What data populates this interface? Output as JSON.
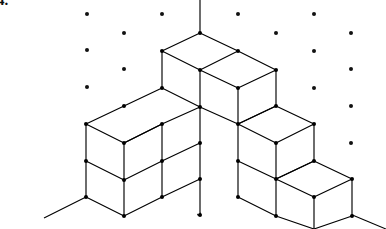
{
  "figure": {
    "label": "4.",
    "type": "isometric-block-diagram",
    "canvas": {
      "width": 386,
      "height": 229,
      "background": "#ffffff"
    },
    "style": {
      "line_color": "#000000",
      "face_color": "#ffffff",
      "dot_color": "#111111",
      "line_width": 1.15,
      "grid_dot_radius": 2.0,
      "vertex_dot_radius": 2.0
    },
    "projection": {
      "origin_x": 200,
      "origin_y": 33,
      "half_width": 37.5,
      "half_height": 18.5,
      "cube_height": 37
    },
    "axes": [
      {
        "name": "vertical-axis",
        "x1": 200,
        "y1": 0,
        "x2": 200,
        "y2": 33
      },
      {
        "name": "left-axis",
        "x1": 86,
        "y1": 197,
        "x2": 44,
        "y2": 218
      },
      {
        "name": "right-axis",
        "x1": 350,
        "y1": 214,
        "x2": 386,
        "y2": 229
      }
    ],
    "grid_dots": [
      {
        "x": 87,
        "y": 14
      },
      {
        "x": 124,
        "y": 33
      },
      {
        "x": 87,
        "y": 50
      },
      {
        "x": 124,
        "y": 69
      },
      {
        "x": 87,
        "y": 87
      },
      {
        "x": 162,
        "y": 14
      },
      {
        "x": 238,
        "y": 14
      },
      {
        "x": 276,
        "y": 33
      },
      {
        "x": 314,
        "y": 14
      },
      {
        "x": 351,
        "y": 33
      },
      {
        "x": 314,
        "y": 51
      },
      {
        "x": 351,
        "y": 69
      },
      {
        "x": 314,
        "y": 88
      },
      {
        "x": 351,
        "y": 106
      },
      {
        "x": 351,
        "y": 143
      },
      {
        "x": 199,
        "y": 214
      }
    ],
    "faces": [
      {
        "name": "top-face-apex-left",
        "kind": "top",
        "points": "200,33 162,51 200,70 238,51"
      },
      {
        "name": "top-face-apex-right",
        "kind": "top",
        "points": "238,51 200,70 238,88 276,70"
      },
      {
        "name": "top-face-left-upper",
        "kind": "top",
        "points": "124,106 86,124 124,143 162,124"
      },
      {
        "name": "top-face-left-mid",
        "kind": "top",
        "points": "162,88 124,106 162,124 200,106"
      },
      {
        "name": "top-face-step-mid",
        "kind": "top",
        "points": "276,106 238,124 276,143 314,124"
      },
      {
        "name": "top-face-step-low",
        "kind": "top",
        "points": "314,161 276,179 314,197 352,179"
      },
      {
        "name": "left-face-apex",
        "kind": "left",
        "points": "162,51 162,88 200,106 200,70"
      },
      {
        "name": "left-face-upper-l",
        "kind": "left",
        "points": "86,124 86,161 124,180 124,143"
      },
      {
        "name": "left-face-lower-l",
        "kind": "left",
        "points": "86,161 86,197 124,216 124,180"
      },
      {
        "name": "left-face-mid",
        "kind": "left",
        "points": "162,124 162,161 200,179 200,143"
      },
      {
        "name": "left-face-mid-low",
        "kind": "left",
        "points": "162,161 162,197 200,215 200,179"
      },
      {
        "name": "left-face-step-mid",
        "kind": "left",
        "points": "238,124 238,161 276,179 276,143"
      },
      {
        "name": "left-face-step-midlow",
        "kind": "left",
        "points": "238,161 238,197 276,215 276,179"
      },
      {
        "name": "left-face-step-low",
        "kind": "left",
        "points": "276,179 276,216 314,229 314,197"
      },
      {
        "name": "right-face-apex",
        "kind": "right",
        "points": "238,88 238,124 276,106 276,70"
      },
      {
        "name": "right-face-upper-r",
        "kind": "right",
        "points": "162,124 162,161 200,143 200,106"
      },
      {
        "name": "right-face-step-mid",
        "kind": "right",
        "points": "276,143 276,179 314,161 314,124"
      },
      {
        "name": "right-face-step-low",
        "kind": "right",
        "points": "314,197 314,229 352,216 352,179"
      }
    ],
    "edges": [
      {
        "name": "e-top-apex-nw",
        "x1": 200,
        "y1": 33,
        "x2": 162,
        "y2": 51
      },
      {
        "name": "e-top-apex-ne",
        "x1": 200,
        "y1": 33,
        "x2": 238,
        "y2": 51
      },
      {
        "name": "e-top-apex-sw",
        "x1": 162,
        "y1": 51,
        "x2": 200,
        "y2": 70
      },
      {
        "name": "e-top-apex-se",
        "x1": 238,
        "y1": 51,
        "x2": 200,
        "y2": 70
      },
      {
        "name": "e-top-r-ne",
        "x1": 238,
        "y1": 51,
        "x2": 276,
        "y2": 70
      },
      {
        "name": "e-top-r-se",
        "x1": 276,
        "y1": 70,
        "x2": 238,
        "y2": 88
      },
      {
        "name": "e-top-r-sw",
        "x1": 238,
        "y1": 88,
        "x2": 200,
        "y2": 70
      },
      {
        "name": "e-v-162-51",
        "x1": 162,
        "y1": 51,
        "x2": 162,
        "y2": 88
      },
      {
        "name": "e-v-200-70",
        "x1": 200,
        "y1": 70,
        "x2": 200,
        "y2": 107
      },
      {
        "name": "e-v-238-88",
        "x1": 238,
        "y1": 88,
        "x2": 238,
        "y2": 124
      },
      {
        "name": "e-v-276-70",
        "x1": 276,
        "y1": 70,
        "x2": 276,
        "y2": 106
      },
      {
        "name": "e-b-apex-sw",
        "x1": 162,
        "y1": 88,
        "x2": 200,
        "y2": 107
      },
      {
        "name": "e-b-apex-se",
        "x1": 238,
        "y1": 124,
        "x2": 200,
        "y2": 107
      },
      {
        "name": "e-b-apex-ne",
        "x1": 238,
        "y1": 124,
        "x2": 276,
        "y2": 106
      },
      {
        "name": "e-l-top-nw",
        "x1": 124,
        "y1": 106,
        "x2": 86,
        "y2": 124
      },
      {
        "name": "e-l-top-ne",
        "x1": 124,
        "y1": 106,
        "x2": 162,
        "y2": 88
      },
      {
        "name": "e-l-top-w-s",
        "x1": 86,
        "y1": 124,
        "x2": 124,
        "y2": 143
      },
      {
        "name": "e-l-top-mid-d",
        "x1": 124,
        "y1": 143,
        "x2": 162,
        "y2": 124
      },
      {
        "name": "e-l-top-e-d",
        "x1": 162,
        "y1": 124,
        "x2": 200,
        "y2": 107
      },
      {
        "name": "e-l-top-inner",
        "x1": 124,
        "y1": 143,
        "x2": 162,
        "y2": 124
      },
      {
        "name": "e-v-86-124",
        "x1": 86,
        "y1": 124,
        "x2": 86,
        "y2": 197
      },
      {
        "name": "e-v-124-143",
        "x1": 124,
        "y1": 143,
        "x2": 124,
        "y2": 216
      },
      {
        "name": "e-v-162-124",
        "x1": 162,
        "y1": 124,
        "x2": 162,
        "y2": 197
      },
      {
        "name": "e-v-200-107",
        "x1": 200,
        "y1": 107,
        "x2": 200,
        "y2": 215
      },
      {
        "name": "e-l-mid-h1",
        "x1": 86,
        "y1": 161,
        "x2": 124,
        "y2": 180
      },
      {
        "name": "e-l-mid-h2",
        "x1": 124,
        "y1": 180,
        "x2": 162,
        "y2": 161
      },
      {
        "name": "e-l-mid-h3",
        "x1": 162,
        "y1": 161,
        "x2": 200,
        "y2": 143
      },
      {
        "name": "e-l-bot-h1",
        "x1": 86,
        "y1": 197,
        "x2": 124,
        "y2": 216
      },
      {
        "name": "e-l-bot-h2",
        "x1": 124,
        "y1": 216,
        "x2": 162,
        "y2": 197
      },
      {
        "name": "e-l-bot-h3",
        "x1": 162,
        "y1": 197,
        "x2": 200,
        "y2": 179
      },
      {
        "name": "e-s-top-nw",
        "x1": 276,
        "y1": 106,
        "x2": 238,
        "y2": 124
      },
      {
        "name": "e-s-top-ne",
        "x1": 276,
        "y1": 106,
        "x2": 314,
        "y2": 124
      },
      {
        "name": "e-s-top-sw",
        "x1": 238,
        "y1": 124,
        "x2": 276,
        "y2": 143
      },
      {
        "name": "e-s-top-se",
        "x1": 314,
        "y1": 124,
        "x2": 276,
        "y2": 143
      },
      {
        "name": "e-v-314-124",
        "x1": 314,
        "y1": 124,
        "x2": 314,
        "y2": 161
      },
      {
        "name": "e-v-276-143",
        "x1": 276,
        "y1": 143,
        "x2": 276,
        "y2": 216
      },
      {
        "name": "e-v-238-124b",
        "x1": 238,
        "y1": 124,
        "x2": 238,
        "y2": 197
      },
      {
        "name": "e-s-mid-h1",
        "x1": 238,
        "y1": 161,
        "x2": 276,
        "y2": 179
      },
      {
        "name": "e-s-mid-h2",
        "x1": 276,
        "y1": 179,
        "x2": 314,
        "y2": 161
      },
      {
        "name": "e-s-bot-h1",
        "x1": 238,
        "y1": 197,
        "x2": 276,
        "y2": 216
      },
      {
        "name": "e-s2-top-nw",
        "x1": 314,
        "y1": 161,
        "x2": 276,
        "y2": 179
      },
      {
        "name": "e-s2-top-ne",
        "x1": 314,
        "y1": 161,
        "x2": 352,
        "y2": 179
      },
      {
        "name": "e-s2-top-sw",
        "x1": 276,
        "y1": 179,
        "x2": 314,
        "y2": 197
      },
      {
        "name": "e-s2-top-se",
        "x1": 352,
        "y1": 179,
        "x2": 314,
        "y2": 197
      },
      {
        "name": "e-v-352-179",
        "x1": 352,
        "y1": 179,
        "x2": 352,
        "y2": 216
      },
      {
        "name": "e-v-314-197",
        "x1": 314,
        "y1": 197,
        "x2": 314,
        "y2": 229
      },
      {
        "name": "e-s2-bot-h1",
        "x1": 276,
        "y1": 216,
        "x2": 314,
        "y2": 229
      },
      {
        "name": "e-s2-bot-h2",
        "x1": 314,
        "y1": 229,
        "x2": 352,
        "y2": 216
      }
    ],
    "vertex_dots": [
      {
        "x": 200,
        "y": 33
      },
      {
        "x": 162,
        "y": 51
      },
      {
        "x": 238,
        "y": 51
      },
      {
        "x": 200,
        "y": 70
      },
      {
        "x": 276,
        "y": 70
      },
      {
        "x": 162,
        "y": 88
      },
      {
        "x": 238,
        "y": 88
      },
      {
        "x": 124,
        "y": 106
      },
      {
        "x": 200,
        "y": 107
      },
      {
        "x": 276,
        "y": 106
      },
      {
        "x": 86,
        "y": 124
      },
      {
        "x": 162,
        "y": 124
      },
      {
        "x": 238,
        "y": 124
      },
      {
        "x": 314,
        "y": 124
      },
      {
        "x": 124,
        "y": 143
      },
      {
        "x": 200,
        "y": 143
      },
      {
        "x": 276,
        "y": 143
      },
      {
        "x": 86,
        "y": 161
      },
      {
        "x": 162,
        "y": 161
      },
      {
        "x": 238,
        "y": 161
      },
      {
        "x": 314,
        "y": 161
      },
      {
        "x": 124,
        "y": 180
      },
      {
        "x": 200,
        "y": 179
      },
      {
        "x": 276,
        "y": 179
      },
      {
        "x": 352,
        "y": 179
      },
      {
        "x": 86,
        "y": 197
      },
      {
        "x": 162,
        "y": 197
      },
      {
        "x": 238,
        "y": 197
      },
      {
        "x": 314,
        "y": 197
      },
      {
        "x": 124,
        "y": 216
      },
      {
        "x": 200,
        "y": 215
      },
      {
        "x": 276,
        "y": 216
      },
      {
        "x": 352,
        "y": 216
      }
    ]
  }
}
